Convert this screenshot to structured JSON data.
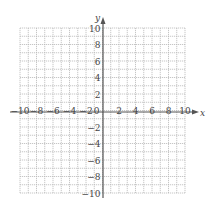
{
  "chart_data": {
    "type": "scatter",
    "title": "",
    "xlabel": "x",
    "ylabel": "y",
    "xlim": [
      -10,
      10
    ],
    "ylim": [
      -10,
      10
    ],
    "grid": true,
    "grid_step": 1,
    "x_ticks": [
      -10,
      -8,
      -6,
      -4,
      -2,
      0,
      2,
      4,
      6,
      8,
      10
    ],
    "y_ticks": [
      -10,
      -8,
      -6,
      -4,
      -2,
      2,
      4,
      6,
      8,
      10
    ],
    "x_tick_labels": [
      "-10",
      "-8",
      "-6",
      "-4",
      "-2",
      "0",
      "2",
      "4",
      "6",
      "8",
      "10"
    ],
    "y_tick_labels": [
      "-10",
      "-8",
      "-6",
      "-4",
      "-2",
      "2",
      "4",
      "6",
      "8",
      "10"
    ],
    "series": [],
    "legend": null
  },
  "axes": {
    "x_label": "x",
    "y_label": "y",
    "colors": {
      "grid": "#b8b8b8",
      "axis": "#555555",
      "text": "#444444"
    }
  }
}
